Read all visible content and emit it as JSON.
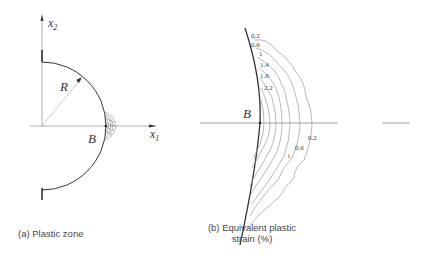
{
  "panel_a": {
    "axis_x_label": "x",
    "axis_x_sub": "1",
    "axis_y_label": "x",
    "axis_y_sub": "2",
    "radius_label": "R",
    "point_label": "B",
    "caption": "(a) Plastic zone"
  },
  "panel_b": {
    "point_label": "B",
    "contour_labels_top": [
      "0.2",
      "0.6",
      "1",
      "1.4",
      "1.8",
      "2.2"
    ],
    "contour_labels_bottom": [
      "0.2",
      "0.6",
      "1"
    ],
    "caption_line1": "(b) Equivalent plastic",
    "caption_line2": "strain (%)"
  },
  "colors": {
    "boundary": "#333333",
    "axis": "#888888",
    "contour": "#999999"
  }
}
